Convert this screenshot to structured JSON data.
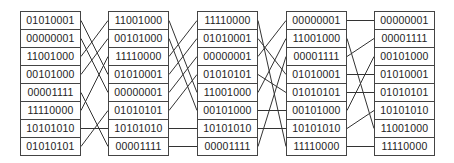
{
  "diagram": {
    "type": "sorting-network-stages",
    "columns": [
      [
        "01010001",
        "00000001",
        "11001000",
        "00101000",
        "00001111",
        "11110000",
        "10101010",
        "01010101"
      ],
      [
        "11001000",
        "00101000",
        "11110000",
        "01010001",
        "00000001",
        "01010101",
        "10101010",
        "00001111"
      ],
      [
        "11110000",
        "01010001",
        "00000001",
        "01010101",
        "11001000",
        "00101000",
        "10101010",
        "00001111"
      ],
      [
        "00000001",
        "11001000",
        "00001111",
        "01010001",
        "01010101",
        "00101000",
        "10101010",
        "11110000"
      ],
      [
        "00000001",
        "00001111",
        "00101000",
        "01010001",
        "01010101",
        "10101010",
        "11001000",
        "11110000"
      ]
    ],
    "line_color": "#333333",
    "border_color": "#444444"
  }
}
